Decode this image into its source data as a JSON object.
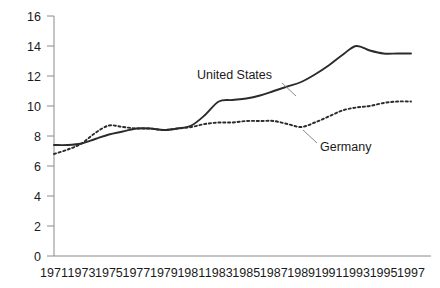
{
  "chart_data": {
    "type": "line",
    "title": "",
    "subtitle": "",
    "xlabel": "",
    "ylabel": "",
    "xlim": [
      1971,
      1997
    ],
    "ylim": [
      0,
      16
    ],
    "y_ticks": [
      0,
      2,
      4,
      6,
      8,
      10,
      12,
      14,
      16
    ],
    "y_tick_labels": [
      "0",
      "2",
      "4",
      "6",
      "8",
      "10",
      "12",
      "14",
      "16"
    ],
    "x_ticks": [
      1971,
      1973,
      1975,
      1977,
      1979,
      1981,
      1983,
      1985,
      1987,
      1989,
      1991,
      1993,
      1995,
      1997
    ],
    "x_tick_labels": [
      "1971",
      "1973",
      "1975",
      "1977",
      "1979",
      "1981",
      "1983",
      "1985",
      "1987",
      "1989",
      "1991",
      "1993",
      "1995",
      "1997"
    ],
    "grid": false,
    "legend_position": "inline-annotation",
    "x": [
      1971,
      1972,
      1973,
      1974,
      1975,
      1976,
      1977,
      1978,
      1979,
      1980,
      1981,
      1982,
      1983,
      1984,
      1985,
      1986,
      1987,
      1988,
      1989,
      1990,
      1991,
      1992,
      1993,
      1994,
      1995,
      1996,
      1997
    ],
    "series": [
      {
        "name": "United States",
        "style": "solid",
        "color": "#2b2b2b",
        "values": [
          7.4,
          7.4,
          7.5,
          7.8,
          8.1,
          8.3,
          8.5,
          8.5,
          8.4,
          8.5,
          8.7,
          9.4,
          10.3,
          10.4,
          10.5,
          10.7,
          11.0,
          11.3,
          11.6,
          12.1,
          12.7,
          13.4,
          14.0,
          13.7,
          13.5,
          13.5,
          13.5
        ]
      },
      {
        "name": "Germany",
        "style": "dotted",
        "color": "#2b2b2b",
        "values": [
          6.8,
          7.1,
          7.5,
          8.2,
          8.7,
          8.6,
          8.5,
          8.5,
          8.4,
          8.5,
          8.6,
          8.8,
          8.9,
          8.9,
          9.0,
          9.0,
          9.0,
          8.8,
          8.6,
          8.9,
          9.3,
          9.7,
          9.9,
          10.0,
          10.2,
          10.3,
          10.3
        ]
      }
    ],
    "annotations": [
      {
        "text": "United States",
        "series": "United States"
      },
      {
        "text": "Germany",
        "series": "Germany"
      }
    ]
  }
}
